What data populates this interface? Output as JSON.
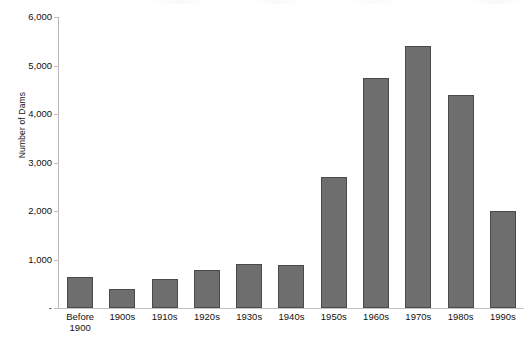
{
  "chart_data": {
    "type": "bar",
    "title": "",
    "xlabel": "",
    "ylabel": "Number of Dams",
    "categories": [
      "Before\n1900",
      "1900s",
      "1910s",
      "1920s",
      "1930s",
      "1940s",
      "1950s",
      "1960s",
      "1970s",
      "1980s",
      "1990s"
    ],
    "values": [
      640,
      390,
      600,
      790,
      910,
      880,
      2700,
      4750,
      5400,
      4400,
      2000
    ],
    "ylim": [
      0,
      6000
    ],
    "y_ticks": [
      0,
      1000,
      2000,
      3000,
      4000,
      5000,
      6000
    ],
    "y_tick_labels": [
      "-",
      "1,000",
      "2,000",
      "3,000",
      "4,000",
      "5,000",
      "6,000"
    ],
    "grid": false,
    "legend": "none",
    "bar_color": "#6e6e6e",
    "bar_edge_color": "#4a4a4a",
    "background_color": "#ffffff",
    "axis_color": "#bdbdbd"
  }
}
